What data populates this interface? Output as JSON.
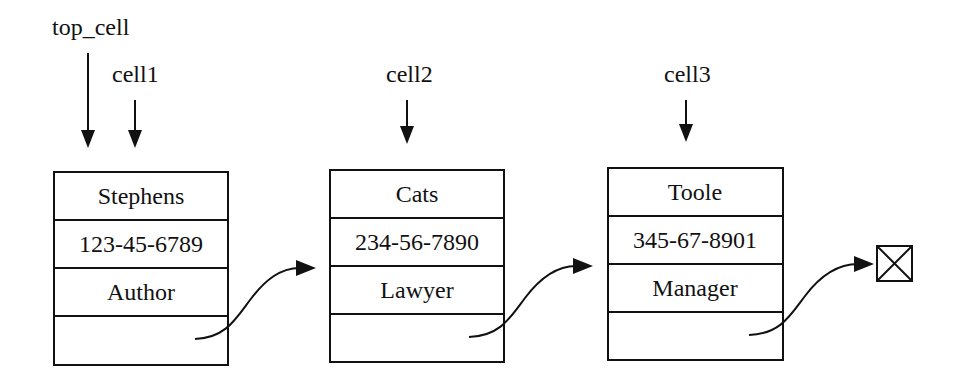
{
  "diagram": {
    "type": "linked-list",
    "pointers": [
      {
        "label": "top_cell",
        "target": "cell1"
      },
      {
        "label": "cell1",
        "target": "cell1"
      },
      {
        "label": "cell2",
        "target": "cell2"
      },
      {
        "label": "cell3",
        "target": "cell3"
      }
    ],
    "cells": [
      {
        "id": "cell1",
        "name": "Stephens",
        "ssn": "123-45-6789",
        "title": "Author",
        "next": "cell2"
      },
      {
        "id": "cell2",
        "name": "Cats",
        "ssn": "234-56-7890",
        "title": "Lawyer",
        "next": "cell3"
      },
      {
        "id": "cell3",
        "name": "Toole",
        "ssn": "345-67-8901",
        "title": "Manager",
        "next": "null"
      }
    ],
    "null_terminator_icon": "crossed-box-icon",
    "colors": {
      "stroke": "#111111",
      "background": "#ffffff"
    }
  }
}
